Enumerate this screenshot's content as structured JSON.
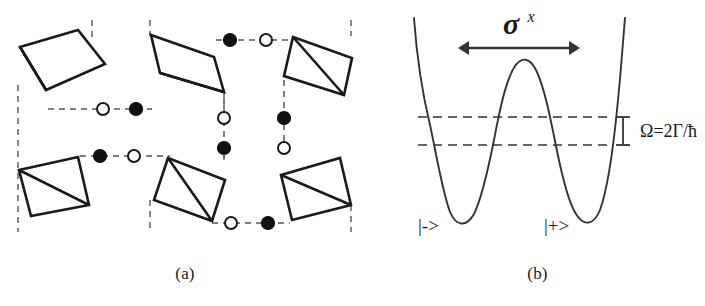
{
  "figure": {
    "panels": [
      {
        "id": "a",
        "caption": "(a)",
        "description": "tetrahedra-lattice"
      },
      {
        "id": "b",
        "caption": "(b)",
        "description": "double-well-potential"
      }
    ]
  },
  "panel_a": {
    "caption": "(a)",
    "tetrahedra": [
      {
        "name": "tetrahedron-top-left",
        "points": "20,47 78,30 105,64 46,90",
        "diagonal": "20,47 46,90"
      },
      {
        "name": "tetrahedron-top-middle",
        "points": "151,35 214,57 224,92 160,73",
        "diagonal": "160,73 224,92"
      },
      {
        "name": "tetrahedron-top-right",
        "points": "293,37 352,58 344,95 284,76",
        "diagonal": "293,37 344,95"
      },
      {
        "name": "tetrahedron-bottom-left",
        "points": "19,170 78,157 89,205 31,216",
        "diagonal": "19,170 89,205"
      },
      {
        "name": "tetrahedron-bottom-middle",
        "points": "168,158 225,180 212,221 154,200",
        "diagonal": "168,158 212,221"
      },
      {
        "name": "tetrahedron-bottom-right",
        "points": "281,175 340,158 351,205 292,220",
        "diagonal": "281,175 351,205"
      }
    ],
    "cell_boundaries": [
      {
        "name": "cell-boundary-left",
        "x1": 18,
        "y1": 85,
        "x2": 18,
        "y2": 232
      },
      {
        "name": "cell-boundary-inner-left",
        "x1": 92,
        "y1": 20,
        "x2": 92,
        "y2": 38
      },
      {
        "name": "cell-boundary-middle-left",
        "x1": 150,
        "y1": 20,
        "x2": 150,
        "y2": 36
      },
      {
        "name": "cell-boundary-middle-low",
        "x1": 150,
        "y1": 200,
        "x2": 150,
        "y2": 232
      },
      {
        "name": "cell-boundary-right-upper",
        "x1": 224,
        "y1": 92,
        "x2": 224,
        "y2": 113
      },
      {
        "name": "cell-boundary-right-lower",
        "x1": 224,
        "y1": 145,
        "x2": 224,
        "y2": 160
      },
      {
        "name": "cell-boundary-far-right",
        "x1": 351,
        "y1": 20,
        "x2": 351,
        "y2": 36
      },
      {
        "name": "cell-boundary-far-right-2",
        "x1": 351,
        "y1": 205,
        "x2": 351,
        "y2": 232
      }
    ],
    "bonds": [
      {
        "name": "bond-upper-left-horizontal",
        "x1": 48,
        "y1": 109,
        "x2": 152,
        "y2": 109
      },
      {
        "name": "bond-upper-right-horizontal",
        "x1": 216,
        "y1": 40,
        "x2": 292,
        "y2": 40
      },
      {
        "name": "bond-lower-left-horizontal",
        "x1": 80,
        "y1": 156,
        "x2": 170,
        "y2": 156
      },
      {
        "name": "bond-lower-right-horizontal",
        "x1": 212,
        "y1": 223,
        "x2": 290,
        "y2": 223
      },
      {
        "name": "bond-inner-left-vertical",
        "x1": 224,
        "y1": 98,
        "x2": 224,
        "y2": 158
      },
      {
        "name": "bond-inner-right-vertical",
        "x1": 284,
        "y1": 80,
        "x2": 284,
        "y2": 150
      }
    ],
    "sites": [
      {
        "name": "site-open-upper-left",
        "type": "open",
        "cx": 103,
        "cy": 109,
        "r": 6
      },
      {
        "name": "site-filled-upper-left",
        "type": "filled",
        "cx": 136,
        "cy": 109,
        "r": 6.5
      },
      {
        "name": "site-filled-upper-right",
        "type": "filled",
        "cx": 230,
        "cy": 40,
        "r": 6.5
      },
      {
        "name": "site-open-upper-right",
        "type": "open",
        "cx": 266,
        "cy": 40,
        "r": 6
      },
      {
        "name": "site-filled-lower-left",
        "type": "filled",
        "cx": 100,
        "cy": 156,
        "r": 6.5
      },
      {
        "name": "site-open-lower-left",
        "type": "open",
        "cx": 134,
        "cy": 156,
        "r": 6
      },
      {
        "name": "site-open-lower-right",
        "type": "open",
        "cx": 231,
        "cy": 223,
        "r": 6
      },
      {
        "name": "site-filled-lower-right",
        "type": "filled",
        "cx": 268,
        "cy": 223,
        "r": 6.5
      },
      {
        "name": "site-open-center-upper",
        "type": "open",
        "cx": 224,
        "cy": 118,
        "r": 6
      },
      {
        "name": "site-filled-center-lower",
        "type": "filled",
        "cx": 224,
        "cy": 148,
        "r": 6.5
      },
      {
        "name": "site-filled-center-right-upper",
        "type": "filled",
        "cx": 284,
        "cy": 118,
        "r": 6.5
      },
      {
        "name": "site-open-center-right-lower",
        "type": "open",
        "cx": 284,
        "cy": 148,
        "r": 6
      }
    ],
    "colors": {
      "stroke": "#1a1a1a",
      "filled_site": "#111111",
      "open_site_fill": "#ffffff",
      "dashed": "#555555"
    }
  },
  "panel_b": {
    "caption": "(b)",
    "tunneling_label": "σ",
    "tunneling_superscript": "x",
    "splitting_label": "Ω=2Γ/ħ",
    "ket_left": "|->",
    "ket_right": "|+>",
    "energy_levels": [
      {
        "name": "energy-level-upper",
        "y": 117,
        "x1": 48,
        "x2": 238
      },
      {
        "name": "energy-level-lower",
        "y": 145,
        "x1": 48,
        "x2": 238
      }
    ],
    "potential_curve": "M 44,18 C 47,60 52,92 60,125 C 66,152 72,190 80,212 C 86,226 96,228 104,214 C 112,198 118,170 124,140 C 130,108 136,80 145,66 C 152,56 160,58 166,70 C 174,86 180,116 186,146 C 192,176 198,202 206,214 C 214,227 224,225 230,210 C 238,188 243,150 247,110 C 251,72 253,40 255,18",
    "arrow": {
      "name": "tunneling-arrow",
      "x1": 88,
      "x2": 210,
      "y": 48
    },
    "bracket": {
      "name": "splitting-bracket",
      "x": 253,
      "y_top": 117,
      "y_bottom": 145,
      "cap_half_width": 7
    },
    "colors": {
      "curve": "#333333",
      "dashed": "#333333",
      "text": "#1a1a1a"
    }
  }
}
